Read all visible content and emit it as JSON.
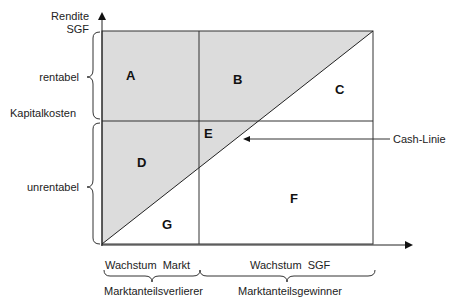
{
  "diagram": {
    "y_axis": {
      "title_line1": "Rendite",
      "title_line2": "SGF"
    },
    "left_labels": {
      "upper": "rentabel",
      "threshold": "Kapitalkosten",
      "lower": "unrentabel"
    },
    "regions": {
      "a": "A",
      "b": "B",
      "c": "C",
      "d": "D",
      "e": "E",
      "f": "F",
      "g": "G"
    },
    "cash_line_label": "Cash-Linie",
    "bottom_labels": {
      "left_top": "Wachstum  Markt",
      "right_top": "Wachstum  SGF",
      "left_bottom": "Marktanteilsverlierer",
      "right_bottom": "Marktanteilsgewinner"
    },
    "colors": {
      "shaded": "#dcdcdc",
      "line": "#333333",
      "background": "#ffffff"
    }
  }
}
